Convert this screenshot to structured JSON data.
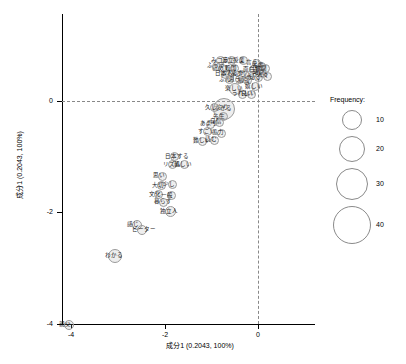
{
  "chart_data": {
    "type": "scatter",
    "title": "",
    "xlabel": "成分1 (0.2043, 100%)",
    "ylabel": "成分1 (0.2043, 100%)",
    "xlim": [
      -4.6,
      0.8
    ],
    "ylim": [
      -4.6,
      0.8
    ],
    "xticks": [
      -4,
      -2,
      0
    ],
    "yticks": [
      -4,
      -2,
      0
    ],
    "grid": false,
    "reference_lines": {
      "x": 0,
      "y": 0,
      "style": "dashed"
    },
    "size_variable": "Frequency",
    "legend": {
      "title": "Frequency:",
      "position": "right",
      "entries": [
        {
          "label": "10",
          "size_px": 20
        },
        {
          "label": "20",
          "size_px": 26
        },
        {
          "label": "30",
          "size_px": 32
        },
        {
          "label": "40",
          "size_px": 38
        }
      ]
    },
    "points": [
      {
        "label": "親父",
        "x": -4.05,
        "y": -4.02,
        "size": 10
      },
      {
        "label": "わかる",
        "x": -3.05,
        "y": -2.78,
        "size": 14
      },
      {
        "label": "感じ",
        "x": -2.58,
        "y": -2.22,
        "size": 10
      },
      {
        "label": "ビーター",
        "x": -2.48,
        "y": -2.32,
        "size": 10
      },
      {
        "label": "独立人",
        "x": -1.88,
        "y": -1.99,
        "size": 11
      },
      {
        "label": "暮らす",
        "x": -2.02,
        "y": -1.82,
        "size": 9
      },
      {
        "label": "文化",
        "x": -2.12,
        "y": -1.68,
        "size": 9
      },
      {
        "label": "一般",
        "x": -1.86,
        "y": -1.7,
        "size": 9
      },
      {
        "label": "大切",
        "x": -2.06,
        "y": -1.52,
        "size": 9
      },
      {
        "label": "少し",
        "x": -1.82,
        "y": -1.5,
        "size": 9
      },
      {
        "label": "思い",
        "x": -2.04,
        "y": -1.35,
        "size": 9
      },
      {
        "label": "リズム",
        "x": -1.82,
        "y": -1.14,
        "size": 9
      },
      {
        "label": "親しい",
        "x": -1.58,
        "y": -1.14,
        "size": 9
      },
      {
        "label": "日本する",
        "x": -1.78,
        "y": -1.0,
        "size": 9
      },
      {
        "label": "難しい",
        "x": -1.18,
        "y": -0.72,
        "size": 9
      },
      {
        "label": "読む",
        "x": -0.92,
        "y": -0.7,
        "size": 9
      },
      {
        "label": "すごい",
        "x": -1.08,
        "y": -0.55,
        "size": 9
      },
      {
        "label": "協力",
        "x": -0.78,
        "y": -0.58,
        "size": 9
      },
      {
        "label": "あまり",
        "x": -1.02,
        "y": -0.42,
        "size": 9
      },
      {
        "label": "自信",
        "x": -0.82,
        "y": -0.38,
        "size": 9
      },
      {
        "label": "先生",
        "x": -0.74,
        "y": -0.28,
        "size": 9
      },
      {
        "label": "できる",
        "x": -0.72,
        "y": -0.14,
        "size": 22
      },
      {
        "label": "久しぶり",
        "x": -0.92,
        "y": -0.12,
        "size": 9
      },
      {
        "label": "楽しい",
        "x": -0.5,
        "y": 0.22,
        "size": 12
      },
      {
        "label": "ふん",
        "x": -0.62,
        "y": 0.38,
        "size": 9
      },
      {
        "label": "思う",
        "x": -0.4,
        "y": 0.38,
        "size": 9
      },
      {
        "label": "勉強",
        "x": -0.22,
        "y": 0.36,
        "size": 9
      },
      {
        "label": "とても",
        "x": -0.6,
        "y": 0.48,
        "size": 9
      },
      {
        "label": "話す",
        "x": -0.36,
        "y": 0.48,
        "size": 9
      },
      {
        "label": "初めて",
        "x": -0.76,
        "y": 0.58,
        "size": 9
      },
      {
        "label": "韓国",
        "x": -0.5,
        "y": 0.58,
        "size": 9
      },
      {
        "label": "ふっう",
        "x": -0.88,
        "y": 0.62,
        "size": 9
      },
      {
        "label": "みコラ",
        "x": -0.8,
        "y": 0.72,
        "size": 9
      },
      {
        "label": "違立",
        "x": -0.56,
        "y": 0.72,
        "size": 9
      },
      {
        "label": "授業",
        "x": -0.32,
        "y": 0.72,
        "size": 9
      },
      {
        "label": "面白い",
        "x": -0.1,
        "y": 0.56,
        "size": 9
      },
      {
        "label": "ちょっと",
        "x": -0.18,
        "y": 0.46,
        "size": 9
      },
      {
        "label": "知る",
        "x": 0.02,
        "y": 0.42,
        "size": 9
      },
      {
        "label": "嬉しい",
        "x": -0.06,
        "y": 0.26,
        "size": 9
      },
      {
        "label": "うれしい",
        "x": -0.34,
        "y": 0.12,
        "size": 9
      },
      {
        "label": "良い",
        "x": -0.14,
        "y": 0.12,
        "size": 9
      },
      {
        "label": "日本人",
        "x": -0.7,
        "y": 0.48,
        "size": 9
      },
      {
        "label": "言う",
        "x": -0.04,
        "y": 0.68,
        "size": 9
      },
      {
        "label": "先輩",
        "x": 0.08,
        "y": 0.62,
        "size": 9
      },
      {
        "label": "仲間",
        "x": 0.16,
        "y": 0.58,
        "size": 9
      },
      {
        "label": "時間",
        "x": 0.1,
        "y": 0.5,
        "size": 9
      },
      {
        "label": "人々",
        "x": 0.2,
        "y": 0.44,
        "size": 9
      }
    ]
  }
}
